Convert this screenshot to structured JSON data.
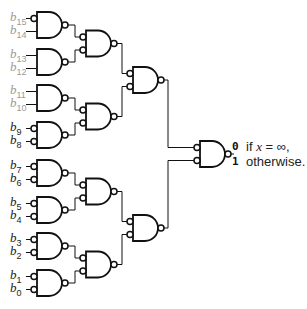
{
  "diagram": {
    "type": "nand-tree",
    "inputs": [
      {
        "name": "b",
        "sub": "15",
        "bubble": true,
        "grey": true
      },
      {
        "name": "b",
        "sub": "14",
        "bubble": false,
        "grey": true
      },
      {
        "name": "b",
        "sub": "13",
        "bubble": false,
        "grey": true
      },
      {
        "name": "b",
        "sub": "12",
        "bubble": false,
        "grey": true
      },
      {
        "name": "b",
        "sub": "11",
        "bubble": false,
        "grey": true
      },
      {
        "name": "b",
        "sub": "10",
        "bubble": false,
        "grey": true
      },
      {
        "name": "b",
        "sub": "9",
        "bubble": true,
        "grey": false
      },
      {
        "name": "b",
        "sub": "8",
        "bubble": true,
        "grey": false
      },
      {
        "name": "b",
        "sub": "7",
        "bubble": true,
        "grey": false
      },
      {
        "name": "b",
        "sub": "6",
        "bubble": true,
        "grey": false
      },
      {
        "name": "b",
        "sub": "5",
        "bubble": true,
        "grey": false
      },
      {
        "name": "b",
        "sub": "4",
        "bubble": true,
        "grey": false
      },
      {
        "name": "b",
        "sub": "3",
        "bubble": true,
        "grey": false
      },
      {
        "name": "b",
        "sub": "2",
        "bubble": true,
        "grey": false
      },
      {
        "name": "b",
        "sub": "1",
        "bubble": true,
        "grey": false
      },
      {
        "name": "b",
        "sub": "0",
        "bubble": true,
        "grey": false
      }
    ],
    "levels": [
      {
        "gate_count": 8,
        "gate": "NAND"
      },
      {
        "gate_count": 4,
        "gate": "NAND",
        "input_bubbles": true
      },
      {
        "gate_count": 2,
        "gate": "NAND",
        "input_bubbles": true
      },
      {
        "gate_count": 1,
        "gate": "NAND",
        "input_bubbles": true
      }
    ],
    "output": {
      "value_0": "0",
      "text_0_prefix": "if ",
      "text_0_var": "x",
      "text_0_suffix": " = ∞,",
      "value_1": "1",
      "text_1": "otherwise."
    },
    "colors": {
      "line": "#111111",
      "grey_label": "#9a9a9a",
      "dark_label": "#222222"
    }
  }
}
